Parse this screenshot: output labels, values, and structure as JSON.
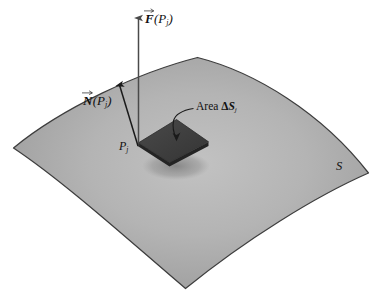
{
  "figure": {
    "kind": "surface-flux-diagram",
    "background_color": "#ffffff",
    "surface": {
      "name": "S",
      "label": "S",
      "fill_light": "#b9b9b9",
      "fill_mid": "#a8a8a8",
      "fill_dark": "#8f8f8f",
      "edge_color": "#3a3a3a"
    },
    "patch": {
      "label_prefix": "Area",
      "label_delta": "Δ",
      "label_symbol": "S",
      "label_subscript": "j",
      "label_full": "Area ΔSⱼ",
      "fill_color": "#3f3f3f",
      "side_color": "#2a2a2a",
      "shadow_color": "#8a8a8a"
    },
    "point": {
      "symbol": "P",
      "subscript": "j",
      "label_full": "Pⱼ"
    },
    "normal_vector": {
      "symbol": "N",
      "argument_open": "(",
      "argument_symbol": "P",
      "argument_subscript": "j",
      "argument_close": ")",
      "label_full": "N⃗(Pⱼ)",
      "color": "#1a1a1a"
    },
    "force_vector": {
      "symbol": "F",
      "argument_open": "(",
      "argument_symbol": "P",
      "argument_subscript": "j",
      "argument_close": ")",
      "label_full": "F⃗(Pⱼ)",
      "color": "#4a4a4a"
    }
  }
}
